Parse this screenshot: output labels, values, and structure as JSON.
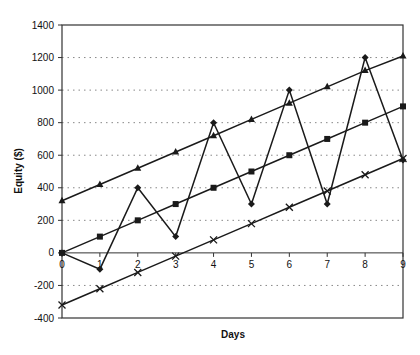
{
  "chart_data": {
    "type": "line",
    "title": "",
    "xlabel": "Days",
    "ylabel": "Equity ($)",
    "x": [
      0,
      1,
      2,
      3,
      4,
      5,
      6,
      7,
      8,
      9
    ],
    "x_tick_labels": [
      "0",
      "1",
      "2",
      "3",
      "4",
      "5",
      "6",
      "7",
      "8",
      "9"
    ],
    "y_tick_labels": [
      "1400",
      "1200",
      "1000",
      "800",
      "600",
      "400",
      "200",
      "0",
      "-200",
      "-400"
    ],
    "ylim": [
      -400,
      1400
    ],
    "xlim": [
      0,
      9
    ],
    "grid": "horizontal dotted",
    "legend": "none",
    "series": [
      {
        "name": "Triangle series",
        "marker": "triangle",
        "values": [
          320,
          420,
          520,
          620,
          720,
          820,
          920,
          1020,
          1120,
          1210
        ]
      },
      {
        "name": "Square series",
        "marker": "square",
        "values": [
          0,
          100,
          200,
          300,
          400,
          500,
          600,
          700,
          800,
          900
        ]
      },
      {
        "name": "Diamond series",
        "marker": "diamond",
        "values": [
          0,
          -100,
          400,
          100,
          800,
          300,
          1000,
          300,
          1200,
          570
        ]
      },
      {
        "name": "Cross series",
        "marker": "cross",
        "values": [
          -320,
          -220,
          -120,
          -20,
          80,
          180,
          280,
          380,
          480,
          580
        ]
      }
    ]
  },
  "colors": {
    "line": "#1a1a1a",
    "grid": "#888888",
    "axis": "#333333",
    "background": "#ffffff"
  }
}
